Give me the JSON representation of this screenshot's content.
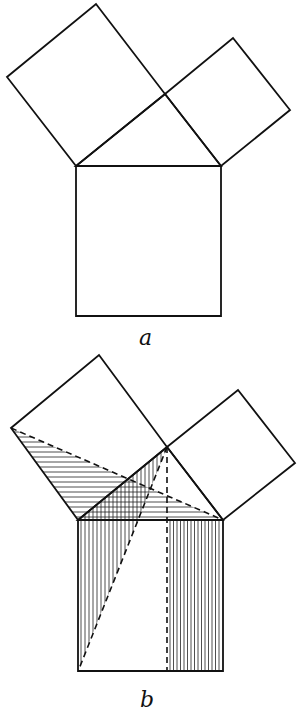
{
  "figure_a": {
    "label": "a",
    "description": "Right triangle with squares on each side (Pythagorean theorem)",
    "points": {
      "A": [
        76,
        166
      ],
      "B": [
        221,
        166
      ],
      "C": [
        165,
        94
      ],
      "sqLeftOuter1": [
        7,
        77
      ],
      "sqLeftOuter2": [
        96,
        4
      ],
      "sqRightOuter1": [
        233,
        38
      ],
      "sqRightOuter2": [
        290,
        110
      ],
      "sqBottom1": [
        76,
        316
      ],
      "sqBottom2": [
        221,
        316
      ]
    }
  },
  "figure_b": {
    "label": "b",
    "description": "Same construction with shaded triangles and dashed auxiliary lines (Euclid's proof)",
    "points": {
      "A": [
        78,
        520
      ],
      "B": [
        223,
        520
      ],
      "C": [
        167,
        447
      ],
      "sqLeftOuter1": [
        11,
        428
      ],
      "sqLeftOuter2": [
        99,
        355
      ],
      "sqRightOuter1": [
        238,
        390
      ],
      "sqRightOuter2": [
        295,
        463
      ],
      "sqBottom1": [
        78,
        671
      ],
      "sqBottom2": [
        223,
        671
      ],
      "altitudeFoot": [
        167,
        671
      ]
    }
  },
  "colors": {
    "stroke": "#111111",
    "background": "#ffffff"
  }
}
